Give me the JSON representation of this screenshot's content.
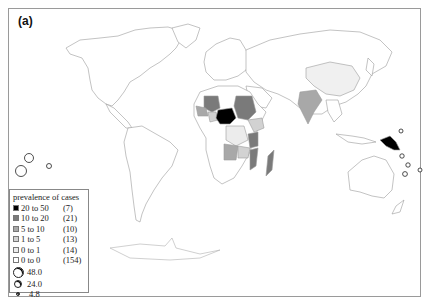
{
  "figure": {
    "panel_label": "(a)"
  },
  "legend": {
    "title": "prevalence of cases",
    "classes": [
      {
        "range": "20 to 50",
        "count": "(7)",
        "color": "#000000"
      },
      {
        "range": "10 to 20",
        "count": "(21)",
        "color": "#7a7a7a"
      },
      {
        "range": "5 to 10",
        "count": "(10)",
        "color": "#a8a8a8"
      },
      {
        "range": "1 to 5",
        "count": "(13)",
        "color": "#d2d2d2"
      },
      {
        "range": "0 to 1",
        "count": "(14)",
        "color": "#ececec"
      },
      {
        "range": "0 to 0",
        "count": "(154)",
        "color": "#ffffff"
      }
    ],
    "bubbles": [
      {
        "label": "48.0",
        "size": 11
      },
      {
        "label": "24.0",
        "size": 8
      },
      {
        "label": "4.8",
        "size": 4
      }
    ]
  },
  "map": {
    "highlighted_regions": [
      {
        "name": "Nigeria",
        "class": "20 to 50"
      },
      {
        "name": "Papua New Guinea",
        "class": "20 to 50"
      },
      {
        "name": "Sudan",
        "class": "10 to 20"
      },
      {
        "name": "Mali",
        "class": "10 to 20"
      },
      {
        "name": "Madagascar",
        "class": "10 to 20"
      },
      {
        "name": "Mozambique",
        "class": "10 to 20"
      },
      {
        "name": "India",
        "class": "5 to 10"
      },
      {
        "name": "Angola",
        "class": "5 to 10"
      },
      {
        "name": "Ethiopia",
        "class": "1 to 5"
      },
      {
        "name": "China",
        "class": "0 to 1"
      }
    ]
  }
}
